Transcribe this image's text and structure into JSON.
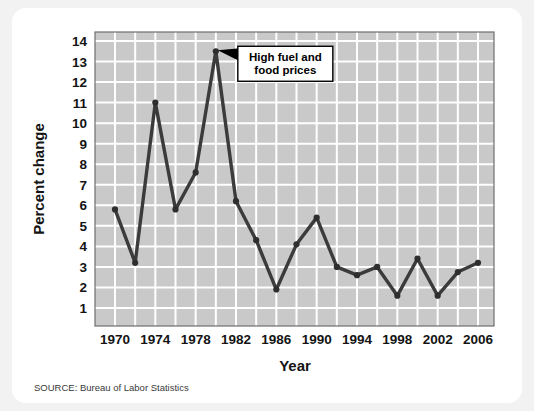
{
  "source_note": "SOURCE: Bureau of Labor Statistics",
  "colors": {
    "page_background": "#f2f2f2",
    "card_background": "#ffffff",
    "plot_background": "#c9c9c9",
    "gridline": "#ffffff",
    "plot_border": "#6e6e6e",
    "line": "#3b3b3b",
    "marker": "#2e2e2e",
    "text": "#141414",
    "annotation_box_background": "#ffffff",
    "annotation_box_border": "#000000"
  },
  "chart_data": {
    "type": "line",
    "title": "",
    "subtitle": "",
    "xlabel": "Year",
    "ylabel": "Percent change",
    "xlim": [
      1969,
      2007
    ],
    "ylim": [
      0,
      14
    ],
    "grid": true,
    "legend": "none",
    "yticks": [
      1,
      2,
      3,
      4,
      5,
      6,
      7,
      8,
      9,
      10,
      11,
      12,
      13,
      14
    ],
    "ytick_labels": [
      "1",
      "2",
      "3",
      "4",
      "5",
      "6",
      "7",
      "8",
      "9",
      "10",
      "11",
      "12",
      "13",
      "14"
    ],
    "xticks": [
      1970,
      1974,
      1978,
      1982,
      1986,
      1990,
      1994,
      1998,
      2002,
      2006
    ],
    "xtick_labels": [
      "1970",
      "1974",
      "1978",
      "1982",
      "1986",
      "1990",
      "1994",
      "1998",
      "2002",
      "2006"
    ],
    "x": [
      1970,
      1972,
      1974,
      1976,
      1978,
      1980,
      1982,
      1984,
      1986,
      1988,
      1990,
      1992,
      1994,
      1996,
      1998,
      2000,
      2002,
      2004,
      2006
    ],
    "values": [
      5.8,
      3.2,
      11.0,
      5.8,
      7.6,
      13.5,
      6.2,
      4.3,
      1.9,
      4.1,
      5.4,
      3.0,
      2.6,
      3.0,
      1.6,
      3.4,
      1.6,
      2.75,
      3.2
    ],
    "series": [
      {
        "name": "Percent change",
        "values": [
          5.8,
          3.2,
          11.0,
          5.8,
          7.6,
          13.5,
          6.2,
          4.3,
          1.9,
          4.1,
          5.4,
          3.0,
          2.6,
          3.0,
          1.6,
          3.4,
          1.6,
          2.75,
          3.2
        ]
      }
    ],
    "annotations": [
      {
        "text_line_1": "High fuel and",
        "text_line_2": "food prices",
        "target_x": 1980,
        "target_y": 13.5
      }
    ]
  }
}
